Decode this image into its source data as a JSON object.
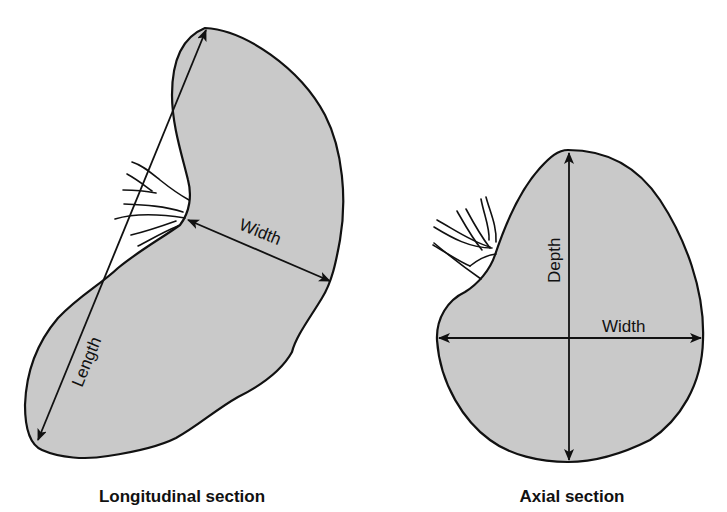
{
  "figures": [
    {
      "id": "longitudinal",
      "caption": "Longitudinal section",
      "labels": {
        "length": "Length",
        "width": "Width"
      }
    },
    {
      "id": "axial",
      "caption": "Axial section",
      "labels": {
        "depth": "Depth",
        "width": "Width"
      }
    }
  ],
  "colors": {
    "fill": "#c9c9c9",
    "stroke": "#111111"
  }
}
